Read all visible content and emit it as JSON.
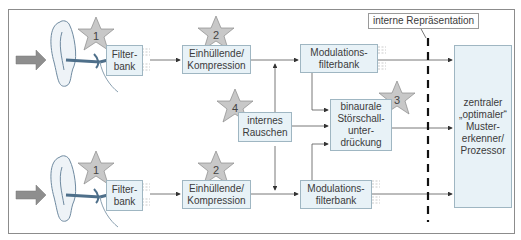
{
  "diagram": {
    "title_label": "interne Repräsentation",
    "colors": {
      "box_fill": "#e8f2f7",
      "box_border": "#9fb6c2",
      "star_fill": "#c8c8c8",
      "arrow_fill": "#8e8e8e",
      "line": "#555555"
    },
    "top_channel": {
      "filterbank": "Filter-\nbank",
      "filterbank_l1": "Filter-",
      "filterbank_l2": "bank",
      "envelope_l1": "Einhüllende/",
      "envelope_l2": "Kompression",
      "modulation_l1": "Modulations-",
      "modulation_l2": "filterbank"
    },
    "bottom_channel": {
      "filterbank_l1": "Filter-",
      "filterbank_l2": "bank",
      "envelope_l1": "Einhüllende/",
      "envelope_l2": "Kompression",
      "modulation_l1": "Modulations-",
      "modulation_l2": "filterbank"
    },
    "noise": {
      "l1": "internes",
      "l2": "Rauschen"
    },
    "binaural": {
      "l1": "binaurale",
      "l2": "Störschall-",
      "l3": "unter-",
      "l4": "drückung"
    },
    "processor": {
      "l1": "zentraler",
      "l2": "„optimaler“",
      "l3": "Muster-",
      "l4": "erkenner/",
      "l5": "Prozessor"
    },
    "stars": [
      {
        "id": "star-1-top",
        "num": "1"
      },
      {
        "id": "star-2-top",
        "num": "2"
      },
      {
        "id": "star-4",
        "num": "4"
      },
      {
        "id": "star-3",
        "num": "3"
      },
      {
        "id": "star-1-bottom",
        "num": "1"
      },
      {
        "id": "star-2-bottom",
        "num": "2"
      }
    ]
  }
}
